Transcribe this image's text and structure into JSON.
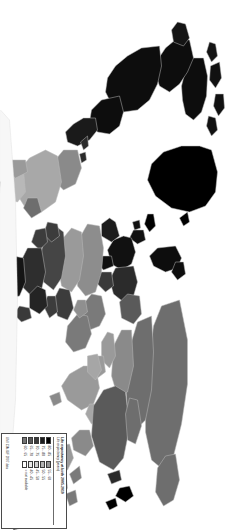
{
  "map": {
    "name": "world-life-expectancy-choropleth",
    "orientation_degrees": 90,
    "background_color": "#ffffff",
    "projection_note": "world map, rotated 90 degrees clockwise on the page",
    "border_color": "#b4b4b4"
  },
  "legend": {
    "title": "Life expectancy at birth 2005-2010",
    "subtitle": "Life expectancy (years)",
    "source": "UN / CIA-IGF 2007 data",
    "not_available_label": "= not available",
    "not_available_color": "#ffffff",
    "classes": [
      {
        "label": "80 - 85",
        "color": "#000000"
      },
      {
        "label": "75 - 80",
        "color": "#1c1c1c"
      },
      {
        "label": "70 - 75",
        "color": "#3a3a3a"
      },
      {
        "label": "65 - 70",
        "color": "#565656"
      },
      {
        "label": "60 - 65",
        "color": "#757575"
      },
      {
        "label": "55 - 60",
        "color": "#949494"
      },
      {
        "label": "50 - 55",
        "color": "#b2b2b2"
      },
      {
        "label": "45 - 50",
        "color": "#cfcfcf"
      },
      {
        "label": "40 - 45",
        "color": "#e8e8e8"
      }
    ]
  },
  "regions": {
    "greenland": {
      "label": "Greenland",
      "color": "#000000"
    },
    "north_america": {
      "label": "North America",
      "color": "#0d0d0d"
    },
    "south_america": {
      "label": "South America",
      "color": "#a8a8a8"
    },
    "europe": {
      "label": "Europe",
      "color": "#1a1a1a"
    },
    "russia": {
      "label": "Russia",
      "color": "#6e6e6e"
    },
    "north_africa": {
      "label": "North Africa",
      "color": "#8d8d8d"
    },
    "sub_saharan_africa": {
      "label": "Sub-Saharan Africa",
      "color": "#3c3c3c"
    },
    "middle_east": {
      "label": "Middle East",
      "color": "#7a7a7a"
    },
    "south_asia": {
      "label": "South Asia",
      "color": "#9a9a9a"
    },
    "china": {
      "label": "China",
      "color": "#5a5a5a"
    },
    "japan": {
      "label": "Japan",
      "color": "#000000"
    },
    "southeast_asia": {
      "label": "Southeast Asia",
      "color": "#8a8a8a"
    },
    "australia": {
      "label": "Australia",
      "color": "#0a0a0a"
    },
    "antarctica": {
      "label": "Antarctica",
      "color": "#f2f2f2"
    }
  }
}
